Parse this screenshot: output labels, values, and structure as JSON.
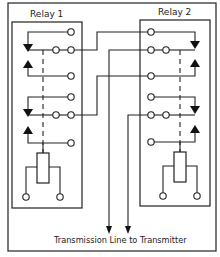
{
  "diagram": {
    "relay1": {
      "label": "Relay 1"
    },
    "relay2": {
      "label": "Relay 2"
    },
    "caption": "Transmission Line to Transmitter",
    "colors": {
      "line": "#222222",
      "background": "#ffffff"
    }
  }
}
